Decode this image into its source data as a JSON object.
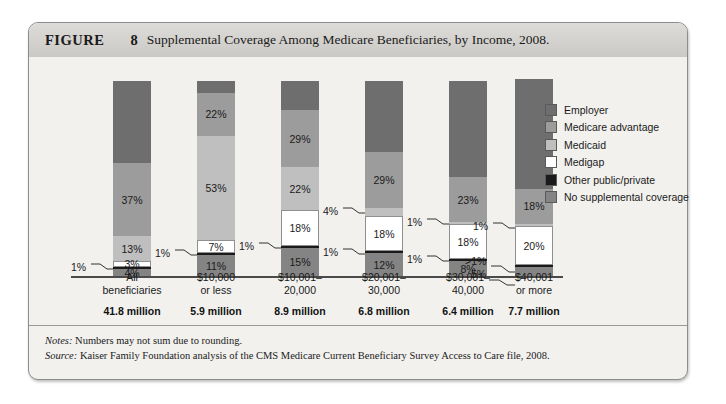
{
  "figure": {
    "label": "FIGURE",
    "number": "8",
    "title": "Supplemental Coverage Among Medicare Beneficiaries, by Income, 2008."
  },
  "legend": {
    "items": [
      {
        "label": "Employer",
        "color": "#6e6e6e"
      },
      {
        "label": "Medicare advantage",
        "color": "#9c9c9c"
      },
      {
        "label": "Medicaid",
        "color": "#bfbfbf"
      },
      {
        "label": "Medigap",
        "color": "#ffffff"
      },
      {
        "label": "Other public/private",
        "color": "#1a1a1a"
      },
      {
        "label": "No supplemental coverage",
        "color": "#848484"
      }
    ]
  },
  "notes": {
    "notes_key": "Notes:",
    "notes_text": " Numbers may not sum due to rounding.",
    "source_key": "Source:",
    "source_text": " Kaiser Family Foundation analysis of the CMS Medicare Current Beneficiary Survey Access to Care file, 2008."
  },
  "chart_data": {
    "type": "bar",
    "subtype": "stacked-100-percent",
    "title": "Supplemental Coverage Among Medicare Beneficiaries, by Income, 2008.",
    "xlabel": "",
    "ylabel": "",
    "ylim": [
      0,
      100
    ],
    "grid": false,
    "legend_position": "right",
    "categories": [
      "All beneficiaries",
      "$10,000 or less",
      "$10,001–20,000",
      "$20,001–30,000",
      "$30,001–40,000",
      "$40,001 or more"
    ],
    "category_counts": [
      "41.8 million",
      "5.9 million",
      "8.9 million",
      "6.8 million",
      "6.4 million",
      "7.7 million"
    ],
    "series": [
      {
        "name": "Employer",
        "color": "#6e6e6e",
        "values": [
          42,
          6,
          15,
          36,
          49,
          56
        ],
        "labels": [
          "",
          "",
          "",
          "",
          "",
          ""
        ]
      },
      {
        "name": "Medicare advantage",
        "color": "#9c9c9c",
        "values": [
          37,
          22,
          29,
          29,
          23,
          18
        ],
        "labels": [
          "37%",
          "22%",
          "29%",
          "29%",
          "23%",
          "18%"
        ]
      },
      {
        "name": "Medicaid",
        "color": "#bfbfbf",
        "values": [
          13,
          53,
          22,
          4,
          1,
          1
        ],
        "labels": [
          "13%",
          "53%",
          "22%",
          "4%",
          "1%",
          ">1%"
        ]
      },
      {
        "name": "Medigap",
        "color": "#ffffff",
        "values": [
          3,
          7,
          18,
          18,
          18,
          20
        ],
        "labels": [
          "3%",
          "7%",
          "18%",
          "18%",
          "18%",
          "20%"
        ]
      },
      {
        "name": "Other public/private",
        "color": "#1a1a1a",
        "values": [
          1,
          1,
          1,
          1,
          1,
          1
        ],
        "labels": [
          "1%",
          "1%",
          "1%",
          "1%",
          "1%",
          "1%"
        ]
      },
      {
        "name": "No supplemental coverage",
        "color": "#848484",
        "values": [
          4,
          11,
          15,
          12,
          8,
          5
        ],
        "labels": [
          "4%",
          "11%",
          "15%",
          "12%",
          "8%",
          "5%"
        ]
      }
    ]
  },
  "bars": [
    {
      "name": "all-beneficiaries",
      "x": 68,
      "cat_line1": "All",
      "cat_line2": "beneficiaries",
      "count": "41.8 million",
      "segments": [
        {
          "series": "Employer",
          "pct": 42,
          "label": "",
          "inside": false
        },
        {
          "series": "Medicare advantage",
          "pct": 37,
          "label": "37%",
          "inside": true
        },
        {
          "series": "Medicaid",
          "pct": 13,
          "label": "13%",
          "inside": true
        },
        {
          "series": "Medigap",
          "pct": 3,
          "label": "3%",
          "inside": true
        },
        {
          "series": "Other public/private",
          "pct": 1,
          "label": "1%",
          "inside": false
        },
        {
          "series": "No supplemental coverage",
          "pct": 4,
          "label": "4%",
          "inside": true
        }
      ]
    },
    {
      "name": "income-10000-or-less",
      "x": 152,
      "cat_line1": "$10,000",
      "cat_line2": "or less",
      "count": "5.9 million",
      "segments": [
        {
          "series": "Employer",
          "pct": 6,
          "label": "",
          "inside": false
        },
        {
          "series": "Medicare advantage",
          "pct": 22,
          "label": "22%",
          "inside": true
        },
        {
          "series": "Medicaid",
          "pct": 53,
          "label": "53%",
          "inside": true
        },
        {
          "series": "Medigap",
          "pct": 7,
          "label": "7%",
          "inside": true
        },
        {
          "series": "Other public/private",
          "pct": 1,
          "label": "1%",
          "inside": false
        },
        {
          "series": "No supplemental coverage",
          "pct": 11,
          "label": "11%",
          "inside": true
        }
      ]
    },
    {
      "name": "income-10001-20000",
      "x": 236,
      "cat_line1": "$10,001–",
      "cat_line2": "20,000",
      "count": "8.9 million",
      "segments": [
        {
          "series": "Employer",
          "pct": 15,
          "label": "",
          "inside": false
        },
        {
          "series": "Medicare advantage",
          "pct": 29,
          "label": "29%",
          "inside": true
        },
        {
          "series": "Medicaid",
          "pct": 22,
          "label": "22%",
          "inside": true
        },
        {
          "series": "Medigap",
          "pct": 18,
          "label": "18%",
          "inside": true
        },
        {
          "series": "Other public/private",
          "pct": 1,
          "label": "1%",
          "inside": false
        },
        {
          "series": "No supplemental coverage",
          "pct": 15,
          "label": "15%",
          "inside": true
        }
      ]
    },
    {
      "name": "income-20001-30000",
      "x": 320,
      "cat_line1": "$20,001–",
      "cat_line2": "30,000",
      "count": "6.8 million",
      "segments": [
        {
          "series": "Employer",
          "pct": 36,
          "label": "",
          "inside": false
        },
        {
          "series": "Medicare advantage",
          "pct": 29,
          "label": "29%",
          "inside": true
        },
        {
          "series": "Medicaid",
          "pct": 4,
          "label": "4%",
          "inside": false
        },
        {
          "series": "Medigap",
          "pct": 18,
          "label": "18%",
          "inside": true
        },
        {
          "series": "Other public/private",
          "pct": 1,
          "label": "1%",
          "inside": false
        },
        {
          "series": "No supplemental coverage",
          "pct": 12,
          "label": "12%",
          "inside": true
        }
      ]
    },
    {
      "name": "income-30001-40000",
      "x": 404,
      "cat_line1": "$30,001–",
      "cat_line2": "40,000",
      "count": "6.4 million",
      "segments": [
        {
          "series": "Employer",
          "pct": 49,
          "label": "",
          "inside": false
        },
        {
          "series": "Medicare advantage",
          "pct": 23,
          "label": "23%",
          "inside": true
        },
        {
          "series": "Medicaid",
          "pct": 1,
          "label": "1%",
          "inside": false
        },
        {
          "series": "Medigap",
          "pct": 18,
          "label": "18%",
          "inside": true
        },
        {
          "series": "Other public/private",
          "pct": 1,
          "label": "1%",
          "inside": false
        },
        {
          "series": "No supplemental coverage",
          "pct": 8,
          "label": "8%",
          "inside": true
        }
      ]
    },
    {
      "name": "income-40001-or-more",
      "x": 470,
      "cat_line1": "$40,001",
      "cat_line2": "or more",
      "count": "7.7 million",
      "segments": [
        {
          "series": "Employer",
          "pct": 56,
          "label": "",
          "inside": false
        },
        {
          "series": "Medicare advantage",
          "pct": 18,
          "label": "18%",
          "inside": true
        },
        {
          "series": "Medicaid",
          "pct": 1,
          "label": "1%",
          "inside": false
        },
        {
          "series": "Medigap",
          "pct": 20,
          "label": "20%",
          "inside": true
        },
        {
          "series": "Other public/private",
          "pct": 1,
          "label": ">1%",
          "inside": false
        },
        {
          "series": "No supplemental coverage",
          "pct": 5,
          "label": "5%",
          "inside": false
        }
      ]
    }
  ]
}
